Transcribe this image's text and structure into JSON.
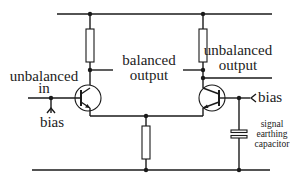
{
  "diagram": {
    "type": "circuit",
    "title": "",
    "labels": {
      "unbalanced_in_line1": "unbalanced",
      "unbalanced_in_line2": "in",
      "left_bias": "bias",
      "balanced_output_line1": "balanced",
      "balanced_output_line2": "output",
      "unbalanced_output_line1": "unbalanced",
      "unbalanced_output_line2": "output",
      "right_bias": "bias",
      "capacitor_line1": "signal",
      "capacitor_line2": "earthing",
      "capacitor_line3": "capacitor"
    },
    "components": [
      {
        "id": "R1",
        "type": "resistor",
        "role": "left collector load"
      },
      {
        "id": "R2",
        "type": "resistor",
        "role": "right collector load"
      },
      {
        "id": "R3",
        "type": "resistor",
        "role": "emitter tail"
      },
      {
        "id": "Q1",
        "type": "npn-transistor",
        "role": "left input transistor"
      },
      {
        "id": "Q2",
        "type": "npn-transistor",
        "role": "right transistor"
      },
      {
        "id": "C1",
        "type": "capacitor",
        "role": "signal earthing capacitor"
      }
    ],
    "colors": {
      "line": "#1a1a1a",
      "text": "#222222",
      "background": "#ffffff"
    }
  }
}
